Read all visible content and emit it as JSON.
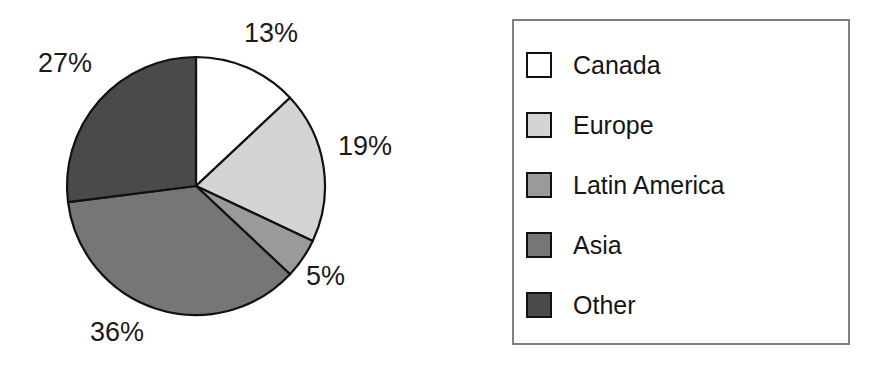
{
  "chart_data": {
    "type": "pie",
    "title": "",
    "subtitle": "",
    "xlabel": "",
    "ylabel": "",
    "legend_position": "right",
    "grid": false,
    "start_angle_deg": 0,
    "direction": "clockwise",
    "categories": [
      "Canada",
      "Europe",
      "Latin America",
      "Asia",
      "Other"
    ],
    "values": [
      13,
      19,
      5,
      36,
      27
    ],
    "value_unit": "%",
    "data_labels": [
      "13%",
      "19%",
      "5%",
      "36%",
      "27%"
    ],
    "slice_colors": [
      "#ffffff",
      "#d4d4d4",
      "#9a9a9a",
      "#767676",
      "#4a4a4a"
    ],
    "slice_edge_color": "#111111",
    "slices": [
      {
        "label": "Canada",
        "value": 13,
        "data_label": "13%",
        "color": "#ffffff"
      },
      {
        "label": "Europe",
        "value": 19,
        "data_label": "19%",
        "color": "#d4d4d4"
      },
      {
        "label": "Latin America",
        "value": 5,
        "data_label": "5%",
        "color": "#9a9a9a"
      },
      {
        "label": "Asia",
        "value": 36,
        "data_label": "36%",
        "color": "#767676"
      },
      {
        "label": "Other",
        "value": 27,
        "data_label": "27%",
        "color": "#4a4a4a"
      }
    ]
  },
  "pie": {
    "labels": {
      "canada": "13%",
      "europe": "19%",
      "latin_america": "5%",
      "asia": "36%",
      "other": "27%"
    }
  },
  "legend": {
    "items": [
      {
        "label": "Canada",
        "color": "#ffffff"
      },
      {
        "label": "Europe",
        "color": "#d4d4d4"
      },
      {
        "label": "Latin America",
        "color": "#9a9a9a"
      },
      {
        "label": "Asia",
        "color": "#767676"
      },
      {
        "label": "Other",
        "color": "#4a4a4a"
      }
    ],
    "border_color": "#808080"
  },
  "colors": {
    "background": "#ffffff",
    "text": "#151515",
    "outline": "#111111"
  }
}
